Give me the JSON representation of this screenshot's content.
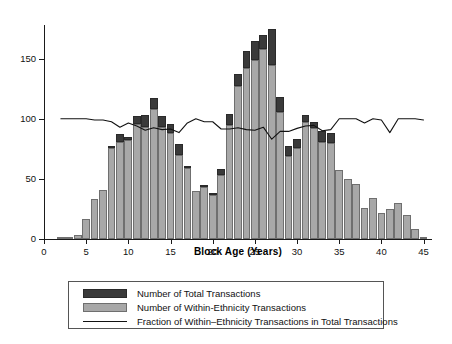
{
  "chart_data": {
    "type": "bar",
    "title": "",
    "subtitle": "",
    "xlabel": "Block Age (Years)",
    "ylabel": "",
    "xlim": [
      0,
      46
    ],
    "ylim": [
      0,
      178
    ],
    "grid": false,
    "stacked": true,
    "xticks": [
      0,
      5,
      10,
      15,
      20,
      25,
      30,
      35,
      40,
      45
    ],
    "xticklabels": [
      "0",
      "5",
      "10",
      "15",
      "20",
      "25",
      "30",
      "35",
      "40",
      "45"
    ],
    "yticks": [
      0,
      50,
      100,
      150
    ],
    "yticklabels": [
      "0",
      "50",
      "100",
      "150"
    ],
    "legend_position": "below-axes",
    "colors": {
      "total": "#3a3a3a",
      "within": "#a8a8a8",
      "line": "#111111",
      "background": "#ffffff"
    },
    "legend": [
      {
        "key": "total-swatch",
        "label": "Number of Total Transactions"
      },
      {
        "key": "within-swatch",
        "label": "Number of Within-Ethnicity Transactions"
      },
      {
        "key": "line-swatch",
        "label": "Fraction of Within–Ethnicity Transactions in Total Transactions"
      }
    ],
    "x": [
      2,
      3,
      4,
      5,
      6,
      7,
      8,
      9,
      10,
      11,
      12,
      13,
      14,
      15,
      16,
      17,
      18,
      19,
      20,
      21,
      22,
      23,
      24,
      25,
      26,
      27,
      28,
      29,
      30,
      31,
      32,
      33,
      34,
      35,
      36,
      37,
      38,
      39,
      40,
      41,
      42,
      43,
      44,
      45
    ],
    "series": [
      {
        "name": "Number of Total Transactions",
        "values": [
          1,
          1,
          3,
          17,
          33,
          41,
          77,
          87,
          85,
          102,
          103,
          117,
          102,
          96,
          79,
          61,
          40,
          44,
          38,
          58,
          104,
          137,
          156,
          165,
          170,
          175,
          118,
          77,
          83,
          103,
          97,
          90,
          88,
          57,
          50,
          46,
          26,
          34,
          22,
          25,
          30,
          20,
          8,
          2
        ]
      },
      {
        "name": "Number of Within-Ethnicity Transactions",
        "values": [
          1,
          1,
          3,
          17,
          33,
          41,
          76,
          81,
          82,
          96,
          93,
          108,
          93,
          88,
          70,
          59,
          40,
          43,
          37,
          53,
          95,
          127,
          142,
          149,
          158,
          145,
          106,
          69,
          76,
          97,
          92,
          81,
          80,
          57,
          50,
          46,
          26,
          34,
          22,
          25,
          30,
          20,
          8,
          2
        ]
      }
    ],
    "fraction_line": {
      "name": "Fraction of Within-Ethnicity Transactions in Total Transactions",
      "note": "plotted on the left axis scaled so 1.00 aligns with 100",
      "x": [
        2,
        3,
        4,
        5,
        6,
        7,
        8,
        9,
        10,
        11,
        12,
        13,
        14,
        15,
        16,
        17,
        18,
        19,
        20,
        21,
        22,
        23,
        24,
        25,
        26,
        27,
        28,
        29,
        30,
        31,
        32,
        33,
        34,
        35,
        36,
        37,
        38,
        39,
        40,
        41,
        42,
        43,
        44,
        45
      ],
      "values": [
        1.0,
        1.0,
        1.0,
        1.0,
        0.99,
        0.99,
        0.975,
        0.93,
        0.965,
        0.94,
        0.905,
        0.925,
        0.91,
        0.915,
        0.885,
        0.965,
        1.0,
        0.975,
        0.975,
        0.915,
        0.915,
        0.925,
        0.91,
        0.905,
        0.93,
        0.83,
        0.895,
        0.895,
        0.92,
        0.94,
        0.945,
        0.9,
        0.91,
        1.0,
        1.0,
        1.0,
        0.965,
        1.0,
        0.99,
        0.885,
        1.0,
        1.0,
        1.0,
        0.99
      ]
    }
  }
}
